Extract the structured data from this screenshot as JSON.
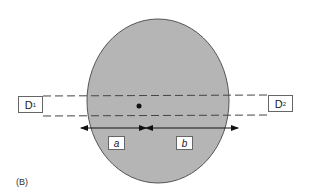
{
  "figure": {
    "panel_label": "(B)",
    "object": {
      "shape": "ellipse",
      "fill": "#b5b5b5",
      "stroke": "#555555"
    },
    "source_point": {
      "label": "",
      "color": "#111111"
    },
    "detectors": [
      {
        "id": "D1",
        "letter": "D",
        "sub": "1"
      },
      {
        "id": "D2",
        "letter": "D",
        "sub": "2"
      }
    ],
    "segments": [
      {
        "id": "a",
        "label": "a"
      },
      {
        "id": "b",
        "label": "b"
      }
    ]
  }
}
